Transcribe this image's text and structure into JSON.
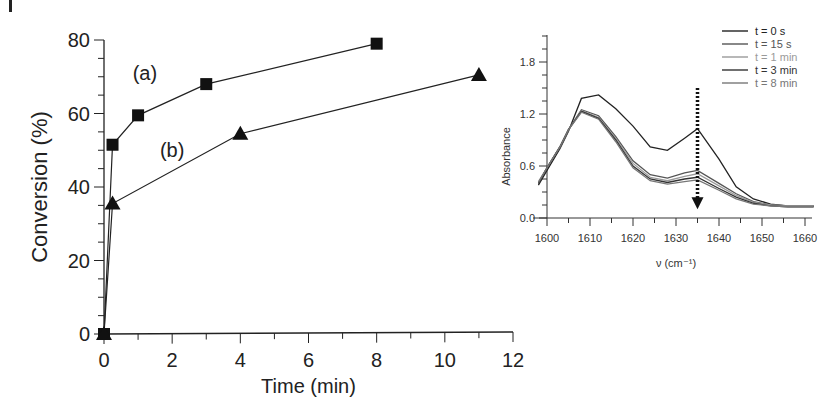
{
  "chart_data": [
    {
      "type": "line",
      "title": "",
      "xlabel": "Time (min)",
      "ylabel": "Conversion (%)",
      "xlim": [
        0,
        12
      ],
      "ylim": [
        0,
        80
      ],
      "xticks": [
        0,
        2,
        4,
        6,
        8,
        10,
        12
      ],
      "yticks": [
        0,
        20,
        40,
        60,
        80
      ],
      "grid": false,
      "series": [
        {
          "name": "(a)",
          "marker": "square",
          "x": [
            0,
            0.25,
            1,
            3,
            8
          ],
          "y": [
            0,
            51.5,
            59.5,
            68,
            79
          ]
        },
        {
          "name": "(b)",
          "marker": "triangle",
          "x": [
            0,
            0.25,
            4,
            11
          ],
          "y": [
            0,
            35.5,
            54.5,
            70.5
          ]
        }
      ],
      "annotations": [
        {
          "text": "(a)",
          "x": 1.2,
          "y": 71
        },
        {
          "text": "(b)",
          "x": 2.0,
          "y": 50
        }
      ]
    },
    {
      "type": "line",
      "title": "",
      "xlabel": "ν (cm⁻¹)",
      "ylabel": "Absorbance",
      "xlim": [
        1598,
        1662
      ],
      "ylim": [
        0,
        2.1
      ],
      "xticks": [
        1600,
        1610,
        1620,
        1630,
        1640,
        1650,
        1660
      ],
      "yticks": [
        0.0,
        0.6,
        1.2,
        1.8
      ],
      "grid": false,
      "legend": "top-right",
      "x": [
        1598,
        1600,
        1603,
        1605,
        1608,
        1612,
        1616,
        1620,
        1624,
        1628,
        1632,
        1635,
        1640,
        1644,
        1648,
        1652,
        1656,
        1660,
        1662
      ],
      "series": [
        {
          "name": "t = 0 s",
          "color": "#222222",
          "values": [
            0.38,
            0.55,
            0.8,
            1.0,
            1.38,
            1.42,
            1.26,
            1.06,
            0.82,
            0.78,
            0.92,
            1.03,
            0.68,
            0.36,
            0.22,
            0.16,
            0.14,
            0.14,
            0.14
          ]
        },
        {
          "name": "t = 15 s",
          "color": "#555555",
          "values": [
            0.4,
            0.58,
            0.82,
            1.02,
            1.25,
            1.18,
            0.94,
            0.66,
            0.5,
            0.46,
            0.52,
            0.55,
            0.4,
            0.28,
            0.19,
            0.15,
            0.14,
            0.14,
            0.14
          ]
        },
        {
          "name": "t = 1 min",
          "color": "#9a9a9a",
          "values": [
            0.42,
            0.58,
            0.82,
            1.02,
            1.24,
            1.16,
            0.92,
            0.63,
            0.47,
            0.43,
            0.48,
            0.51,
            0.37,
            0.26,
            0.18,
            0.15,
            0.14,
            0.14,
            0.14
          ]
        },
        {
          "name": "t = 3 min",
          "color": "#333333",
          "values": [
            0.4,
            0.58,
            0.82,
            1.02,
            1.23,
            1.15,
            0.9,
            0.6,
            0.45,
            0.41,
            0.45,
            0.47,
            0.34,
            0.24,
            0.17,
            0.14,
            0.13,
            0.13,
            0.13
          ]
        },
        {
          "name": "t = 8 min",
          "color": "#777777",
          "values": [
            0.41,
            0.58,
            0.82,
            1.02,
            1.22,
            1.14,
            0.88,
            0.58,
            0.43,
            0.39,
            0.42,
            0.44,
            0.32,
            0.22,
            0.16,
            0.14,
            0.13,
            0.13,
            0.13
          ]
        }
      ],
      "arrow": {
        "x": 1635,
        "from": 1.5,
        "to": 0.1,
        "style": "dotted"
      }
    }
  ]
}
